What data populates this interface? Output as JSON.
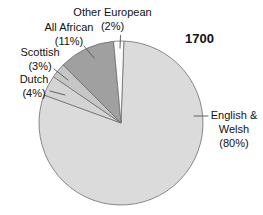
{
  "chart_data": {
    "type": "pie",
    "year_label": "1700",
    "units": "percent",
    "slices": [
      {
        "name": "English & Welsh",
        "value": 80,
        "color": "#dbdbdb"
      },
      {
        "name": "Dutch",
        "value": 4,
        "color": "#d4d4d4"
      },
      {
        "name": "Scottish",
        "value": 3,
        "color": "#c6c6c6"
      },
      {
        "name": "All African",
        "value": 11,
        "color": "#a0a0a0"
      },
      {
        "name": "Other European",
        "value": 2,
        "color": "#fafafa"
      }
    ],
    "start_angle_deg": 2,
    "direction": "clockwise",
    "center_px": [
      121,
      123
    ],
    "radius_px": 82,
    "outline_color": "#6e6e6e",
    "leader_line_color": "#555555",
    "text_color": "#111111",
    "background": "#ffffff",
    "legend_position": "none"
  },
  "labels": {
    "other_european": {
      "line1": "Other European",
      "line2": "(2%)"
    },
    "all_african": {
      "line1": "All African",
      "line2": "(11%)"
    },
    "scottish": {
      "line1": "Scottish",
      "line2": "(3%)"
    },
    "dutch": {
      "line1": "Dutch",
      "line2": "(4%)"
    },
    "english_welsh": {
      "line1": "English &",
      "line2": "Welsh",
      "line3": "(80%)"
    }
  }
}
